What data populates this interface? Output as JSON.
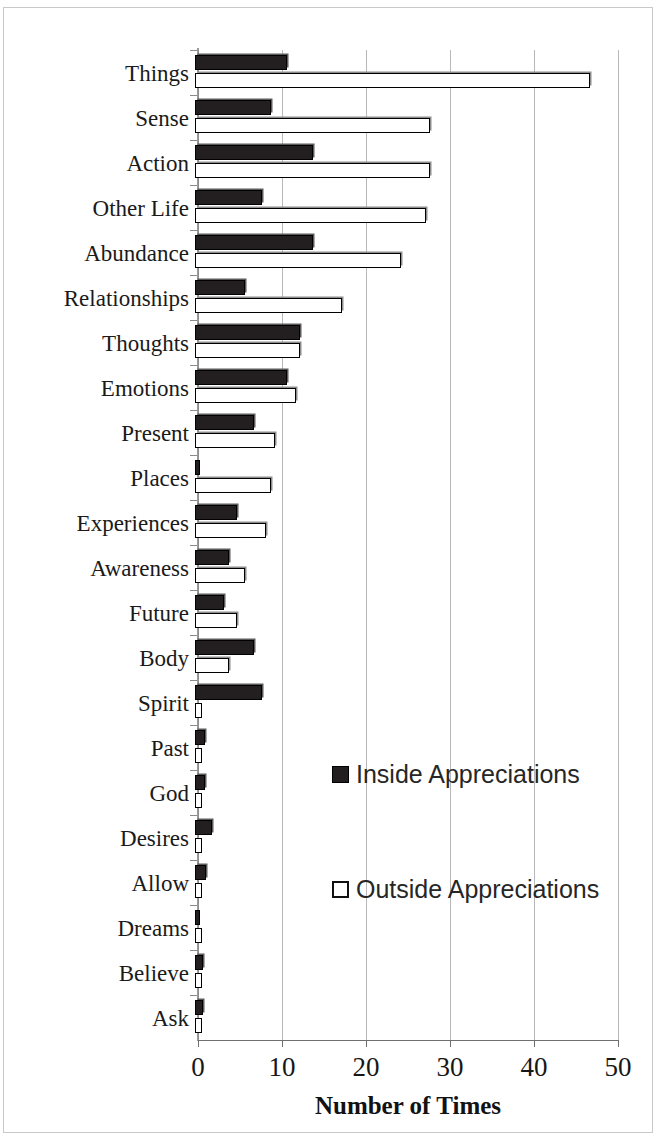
{
  "chart_data": {
    "type": "bar",
    "orientation": "horizontal",
    "title": "",
    "xlabel": "Number of Times",
    "ylabel": "",
    "xlim": [
      0,
      50
    ],
    "xticks": [
      0,
      10,
      20,
      30,
      40,
      50
    ],
    "grid": true,
    "legend_position": "center-right inside plot",
    "categories": [
      "Things",
      "Sense",
      "Action",
      "Other Life",
      "Abundance",
      "Relationships",
      "Thoughts",
      "Emotions",
      "Present",
      "Places",
      "Experiences",
      "Awareness",
      "Future",
      "Body",
      "Spirit",
      "Past",
      "God",
      "Desires",
      "Allow",
      "Dreams",
      "Believe",
      "Ask"
    ],
    "series": [
      {
        "name": "Inside Appreciations",
        "color": "#231f20",
        "style": "filled",
        "values": [
          11,
          9,
          14,
          8,
          14,
          6,
          12.5,
          11,
          7,
          0.5,
          5,
          4,
          3.5,
          7,
          8,
          1.2,
          1.2,
          2,
          1.3,
          0.5,
          1,
          1
        ]
      },
      {
        "name": "Outside Appreciations",
        "color": "#ffffff",
        "style": "hollow",
        "values": [
          47,
          28,
          28,
          27.5,
          24.5,
          17.5,
          12.5,
          12,
          9.5,
          9,
          8.5,
          6,
          5,
          4,
          0.4,
          0.4,
          0.4,
          0.4,
          0.6,
          0.2,
          0.3,
          0.3
        ]
      }
    ]
  },
  "legend": {
    "inside_label": "Inside Appreciations",
    "outside_label": "Outside Appreciations",
    "inside_swatch_icon": "filled-square-icon",
    "outside_swatch_icon": "hollow-square-icon"
  },
  "axis": {
    "x_title": "Number of Times",
    "tick_labels": [
      "0",
      "10",
      "20",
      "30",
      "40",
      "50"
    ]
  }
}
